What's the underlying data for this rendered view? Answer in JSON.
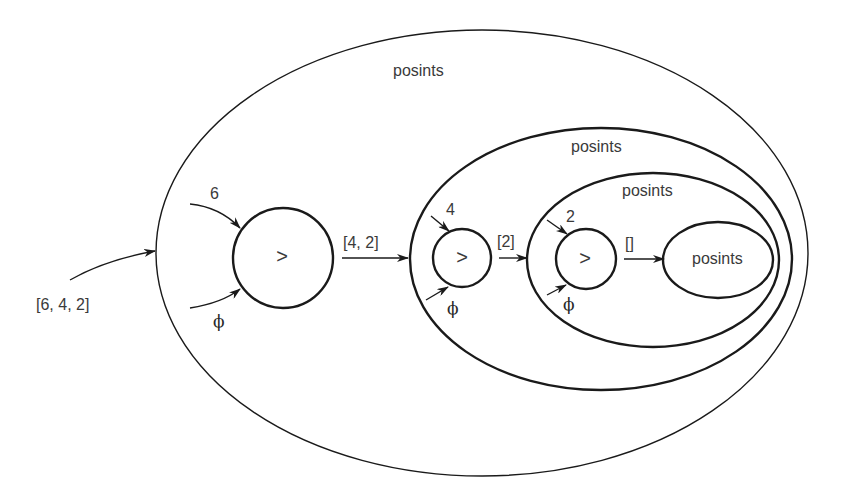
{
  "diagram": {
    "type": "nested-filter-sieve",
    "colors": {
      "stroke": "#1a1a1a",
      "text": "#3a3a3a",
      "background": "#ffffff"
    },
    "input_label": "[6, 4, 2]",
    "sets": [
      {
        "level": 1,
        "label": "posints"
      },
      {
        "level": 2,
        "label": "posints"
      },
      {
        "level": 3,
        "label": "posints"
      },
      {
        "level": 4,
        "label": "posints"
      }
    ],
    "filters": [
      {
        "op": ">",
        "head_input": "6",
        "tail_input": "ϕ",
        "output": "[4, 2]"
      },
      {
        "op": ">",
        "head_input": "4",
        "tail_input": "ϕ",
        "output": "[2]"
      },
      {
        "op": ">",
        "head_input": "2",
        "tail_input": "ϕ",
        "output": "[]"
      }
    ]
  }
}
